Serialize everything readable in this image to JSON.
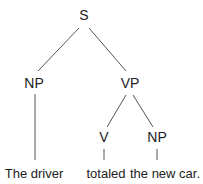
{
  "tree": {
    "root": "S",
    "nodes": {
      "s": "S",
      "np_subject": "NP",
      "vp": "VP",
      "v": "V",
      "np_object": "NP"
    },
    "words": {
      "subject": "The driver",
      "verb": "totaled",
      "object": "the new car."
    }
  }
}
